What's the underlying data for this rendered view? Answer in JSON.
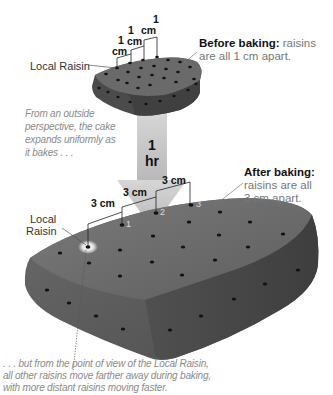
{
  "before": {
    "heading_bold": "Before baking:",
    "heading_rest_line1": "raisins",
    "heading_line2": "are all 1 cm apart.",
    "local_raisin_label": "Local Raisin",
    "distance_labels": [
      {
        "num": "1",
        "unit": "cm"
      },
      {
        "num": "1",
        "unit": "cm"
      },
      {
        "num": "1",
        "unit": "cm"
      }
    ],
    "raisin_numbers": [
      "1",
      "2",
      "3"
    ]
  },
  "arrow": {
    "line1": "1",
    "line2": "hr",
    "color": "#c8c8c8"
  },
  "outside_caption": {
    "lines": [
      "From an outside",
      "perspective, the cake",
      "expands uniformly as",
      "it bakes . . ."
    ]
  },
  "after": {
    "heading_bold": "After baking:",
    "heading_line2": "raisins are all",
    "heading_line3": "3 cm apart.",
    "local_raisin_label_line1": "Local",
    "local_raisin_label_line2": "Raisin",
    "distance_labels": [
      "3 cm",
      "3 cm",
      "3 cm"
    ],
    "raisin_numbers": [
      "1",
      "2",
      "3"
    ]
  },
  "inside_caption": {
    "lines": [
      ". . . but from the point of view of the Local Raisin,",
      "all other raisins move farther away during baking,",
      "with more distant raisins moving faster."
    ]
  },
  "colors": {
    "cake_top": "#6e6e6e",
    "cake_side_left": "#5a5a5a",
    "cake_side_right": "#4a4a4a",
    "raisin": "#111111",
    "caption_text": "#8a8a8a"
  }
}
